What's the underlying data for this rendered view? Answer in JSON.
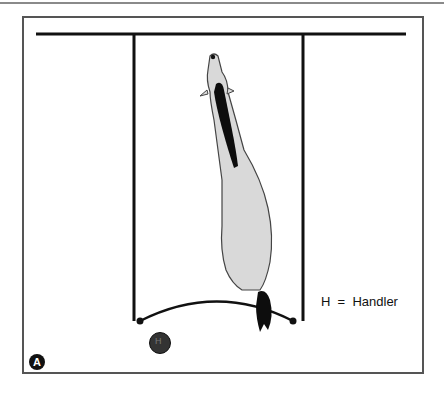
{
  "figure": {
    "panel_label": "A",
    "legend": {
      "symbol": "H",
      "separator": "=",
      "meaning": "Handler",
      "text": "H  =  Handler"
    },
    "handler_marker_label": "H"
  },
  "colors": {
    "line": "#111111",
    "animal_body": "#d9d9d9",
    "animal_dark": "#0d0d0d",
    "handler": "#333333",
    "frame": "#555555"
  }
}
